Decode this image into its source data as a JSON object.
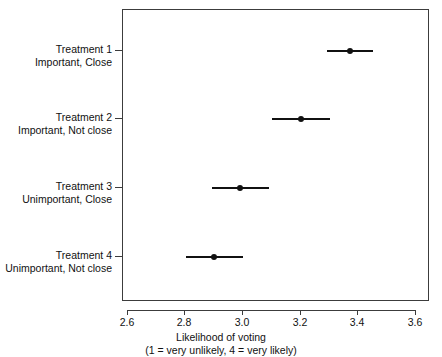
{
  "chart_data": {
    "type": "scatter",
    "title": "",
    "xlabel": "Likelihood of voting",
    "xlabel_sub": "(1 = very unlikely, 4 = very likely)",
    "ylabel": "",
    "xlim": [
      2.5,
      3.65
    ],
    "xticks": [
      2.6,
      2.8,
      3.0,
      3.2,
      3.4,
      3.6
    ],
    "xticklabels": [
      "2.6",
      "2.8",
      "3.0",
      "3.2",
      "3.4",
      "3.6"
    ],
    "grid": false,
    "legend": "none",
    "orientation": "horizontal",
    "categories": [
      "Treatment 1 / Important, Close",
      "Treatment 2 / Important, Not close",
      "Treatment 3 / Unimportant, Close",
      "Treatment 4 / Unimportant, Not close"
    ],
    "values": [
      3.37,
      3.2,
      2.99,
      2.9
    ],
    "ci_low": [
      3.29,
      3.1,
      2.89,
      2.8
    ],
    "ci_high": [
      3.45,
      3.3,
      3.09,
      3.0
    ],
    "marker": "filled-circle",
    "series_color": "#111111"
  },
  "axis": {
    "x_tick_labels": [
      "2.6",
      "2.8",
      "3.0",
      "3.2",
      "3.4",
      "3.6"
    ],
    "x_title": "Likelihood of voting",
    "x_title_sub": "(1 = very unlikely, 4 = very likely)"
  },
  "categories": [
    {
      "id": "treatment-1",
      "line1": "Treatment 1",
      "line2": "Important, Close",
      "estimate": 3.37,
      "ci_low": 3.29,
      "ci_high": 3.45
    },
    {
      "id": "treatment-2",
      "line1": "Treatment 2",
      "line2": "Important, Not close",
      "estimate": 3.2,
      "ci_low": 3.1,
      "ci_high": 3.3
    },
    {
      "id": "treatment-3",
      "line1": "Treatment 3",
      "line2": "Unimportant, Close",
      "estimate": 2.99,
      "ci_low": 2.89,
      "ci_high": 3.09
    },
    {
      "id": "treatment-4",
      "line1": "Treatment 4",
      "line2": "Unimportant, Not close",
      "estimate": 2.9,
      "ci_low": 2.8,
      "ci_high": 3.0
    }
  ],
  "colors": {
    "axis": "#3c3c3c",
    "marker": "#111111",
    "text": "#111111",
    "background": "#ffffff"
  }
}
